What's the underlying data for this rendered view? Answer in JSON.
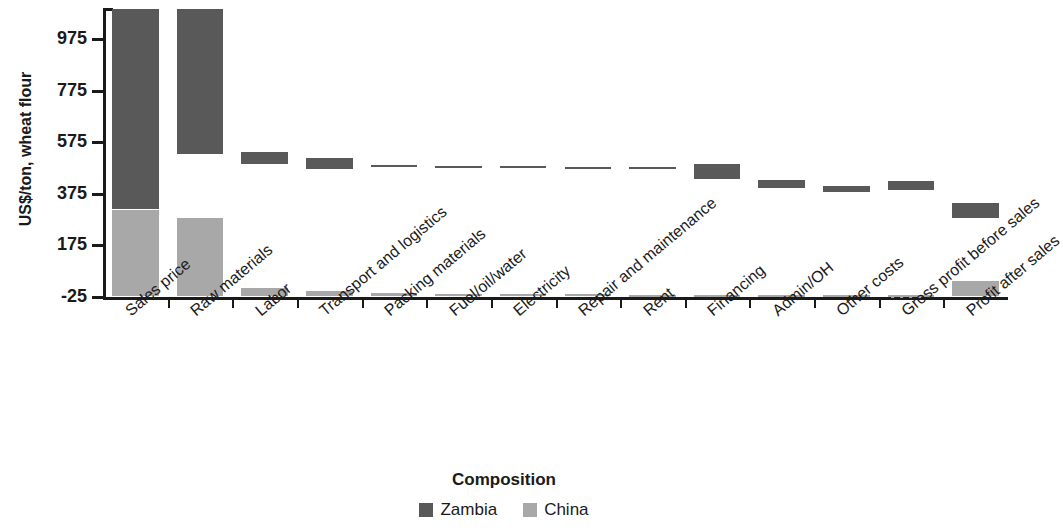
{
  "chart_data": {
    "type": "bar",
    "subtype": "waterfall-cost-composition",
    "title": "",
    "xlabel": "Composition",
    "ylabel": "US$/ton, wheat flour",
    "ylim": [
      -25,
      1095
    ],
    "yticks": [
      -25,
      175,
      375,
      575,
      775,
      975
    ],
    "ytick_labels": [
      "-25",
      "175",
      "375",
      "575",
      "775",
      "975"
    ],
    "grid": false,
    "zero_reference_line": -25,
    "legend_position": "bottom-center",
    "categories": [
      "Sales price",
      "Raw materials",
      "Labor",
      "Transport and logistics",
      "Packing materials",
      "Fuel/oil/water",
      "Electricity",
      "Repair and maintenance",
      "Rent",
      "Financing",
      "Admin/OH",
      "Other costs",
      "Gross profit before sales",
      "Profit after sales"
    ],
    "series": [
      {
        "name": "Zambia",
        "color": "#595959",
        "segments": [
          {
            "category": "Sales price",
            "bottom": 315,
            "top": 1093
          },
          {
            "category": "Raw materials",
            "bottom": 530,
            "top": 1093
          },
          {
            "category": "Labor",
            "bottom": 490,
            "top": 537
          },
          {
            "category": "Transport and logistics",
            "bottom": 472,
            "top": 512
          },
          {
            "category": "Packing materials",
            "bottom": 478,
            "top": 486
          },
          {
            "category": "Fuel/oil/water",
            "bottom": 478,
            "top": 482
          },
          {
            "category": "Electricity",
            "bottom": 476,
            "top": 482
          },
          {
            "category": "Repair and maintenance",
            "bottom": 476,
            "top": 480
          },
          {
            "category": "Rent",
            "bottom": 476,
            "top": 478
          },
          {
            "category": "Financing",
            "bottom": 432,
            "top": 490
          },
          {
            "category": "Admin/OH",
            "bottom": 396,
            "top": 430
          },
          {
            "category": "Other costs",
            "bottom": 380,
            "top": 406
          },
          {
            "category": "Gross profit before sales",
            "bottom": 390,
            "top": 425
          },
          {
            "category": "Profit after sales",
            "bottom": 283,
            "top": 340
          }
        ]
      },
      {
        "name": "China",
        "color": "#a8a8a8",
        "segments": [
          {
            "category": "Sales price",
            "bottom": -21,
            "top": 312
          },
          {
            "category": "Raw materials",
            "bottom": -21,
            "top": 283
          },
          {
            "category": "Labor",
            "bottom": -21,
            "top": 10
          },
          {
            "category": "Transport and logistics",
            "bottom": -21,
            "top": -3
          },
          {
            "category": "Packing materials",
            "bottom": -21,
            "top": -11
          },
          {
            "category": "Fuel/oil/water",
            "bottom": -21,
            "top": -13
          },
          {
            "category": "Electricity",
            "bottom": -21,
            "top": -13
          },
          {
            "category": "Repair and maintenance",
            "bottom": -21,
            "top": -15
          },
          {
            "category": "Rent",
            "bottom": -21,
            "top": -19
          },
          {
            "category": "Financing",
            "bottom": -21,
            "top": -19
          },
          {
            "category": "Admin/OH",
            "bottom": -23,
            "top": -16
          },
          {
            "category": "Other costs",
            "bottom": -25,
            "top": -16
          },
          {
            "category": "Gross profit before sales",
            "bottom": -27,
            "top": -16
          },
          {
            "category": "Profit after sales",
            "bottom": -21,
            "top": 36
          }
        ]
      }
    ],
    "legend": [
      {
        "label": "Zambia",
        "color": "#595959"
      },
      {
        "label": "China",
        "color": "#a8a8a8"
      }
    ]
  },
  "colors": {
    "zambia": "#595959",
    "china": "#a8a8a8",
    "axis": "#1a1a1a",
    "background": "#ffffff"
  }
}
